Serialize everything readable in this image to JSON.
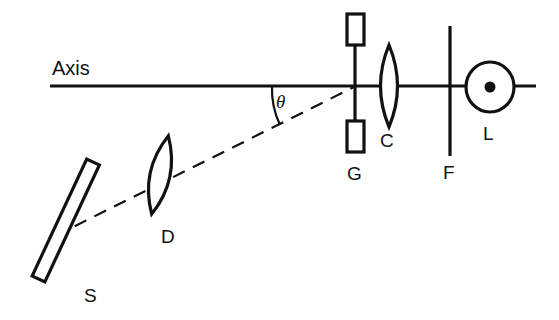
{
  "figure": {
    "background_color": "#ffffff",
    "ink_color": "#111111"
  },
  "labels": {
    "axis": "Axis",
    "theta": "θ",
    "source": "S",
    "collimator": "D",
    "grating": "G",
    "camera_lens": "C",
    "filter": "F",
    "detector": "L"
  },
  "components": [
    {
      "id": "axis-line",
      "label": "Axis",
      "icon": "horizontal-axis-line",
      "type": "line",
      "x1": 50,
      "y1": 86,
      "x2": 536,
      "y2": 86,
      "stroke_width": 3.0,
      "label_x": 52,
      "label_y": 73
    },
    {
      "id": "source-slit",
      "label": "S",
      "icon": "tilted-slit-rectangle",
      "type": "tilted-rectangle",
      "center_x": 66,
      "center_y": 220,
      "width": 14,
      "height": 129,
      "rotation_deg": 25,
      "stroke_width": 3.0,
      "label_x": 85,
      "label_y": 301
    },
    {
      "id": "collimator-lens",
      "label": "D",
      "icon": "biconvex-lens",
      "type": "biconvex-lens",
      "center_x": 160,
      "center_y": 175,
      "half_height": 40,
      "bulge": 17,
      "rotation_deg": 12,
      "stroke_width": 3.0,
      "label_x": 163,
      "label_y": 241
    },
    {
      "id": "diffraction-grating",
      "label": "G",
      "icon": "grating-with-jaws",
      "type": "vertical-bar-with-blocks",
      "x": 355,
      "y_top": 20,
      "y_bottom": 152,
      "block_width": 16,
      "block_height": 30,
      "block_top_y": 14,
      "block_bottom_y": 122,
      "stroke_width": 3.0,
      "label_x": 348,
      "label_y": 178
    },
    {
      "id": "camera-lens",
      "label": "C",
      "icon": "biconvex-lens",
      "type": "biconvex-lens",
      "center_x": 389,
      "center_y": 86,
      "half_height": 41,
      "bulge": 15,
      "rotation_deg": 0,
      "stroke_width": 3.0,
      "label_x": 381,
      "label_y": 145
    },
    {
      "id": "filter-plate",
      "label": "F",
      "icon": "vertical-plate-line",
      "type": "line",
      "x1": 450,
      "y1": 26,
      "x2": 450,
      "y2": 156,
      "stroke_width": 3.0,
      "label_x": 443,
      "label_y": 177
    },
    {
      "id": "detector-eye",
      "label": "L",
      "icon": "circle-with-center-dot",
      "type": "circle-dot",
      "center_x": 490,
      "center_y": 87,
      "radius_x": 24,
      "radius_y": 25,
      "dot_radius": 5.5,
      "stroke_width": 3.0,
      "label_x": 483,
      "label_y": 138
    }
  ],
  "ray": {
    "id": "dashed-ray",
    "icon": "dashed-ray-line",
    "description": "Dashed optical ray from source S through lens D to grating G",
    "x1": 55,
    "y1": 236,
    "x2": 356,
    "y2": 86,
    "style": "dashed",
    "stroke_width": 2.2
  },
  "angle": {
    "id": "theta-angle",
    "symbol": "θ",
    "vertex_x": 356,
    "vertex_y": 86,
    "arc_radius": 84,
    "between": [
      "axis-line",
      "dashed-ray"
    ],
    "label_x": 276,
    "label_y": 106
  }
}
